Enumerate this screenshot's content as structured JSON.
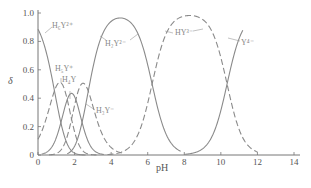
{
  "chart_data": {
    "type": "line",
    "title": "",
    "xlabel": "pH",
    "ylabel": "δ",
    "xlim": [
      0,
      14
    ],
    "ylim": [
      0,
      1.0
    ],
    "grid": false,
    "legend": "inline labels",
    "x_ticks": [
      "0",
      "2",
      "4",
      "6",
      "8",
      "10",
      "12",
      "14"
    ],
    "y_ticks": [
      "0",
      "0.2",
      "0.4",
      "0.6",
      "0.8",
      "1.0"
    ],
    "pKa": [
      0.9,
      1.6,
      2.07,
      2.75,
      6.24,
      10.34
    ],
    "series": [
      {
        "name": "H6Y2+",
        "label": "H₆Y²⁺",
        "style": "solid",
        "x_range": [
          0,
          2.6
        ],
        "points": [
          [
            0,
            0.89
          ],
          [
            0.5,
            0.72
          ],
          [
            1.0,
            0.44
          ],
          [
            1.5,
            0.18
          ],
          [
            2.0,
            0.05
          ],
          [
            2.5,
            0.01
          ]
        ]
      },
      {
        "name": "H5Y+",
        "label": "H₅Y⁺",
        "style": "dashed",
        "x_range": [
          0,
          3.2
        ],
        "points": [
          [
            0,
            0.11
          ],
          [
            0.5,
            0.29
          ],
          [
            1.0,
            0.44
          ],
          [
            1.2,
            0.45
          ],
          [
            1.5,
            0.37
          ],
          [
            2.0,
            0.2
          ],
          [
            2.5,
            0.07
          ],
          [
            3.0,
            0.02
          ]
        ]
      },
      {
        "name": "H4Y",
        "label": "H₄Y",
        "style": "solid",
        "x_range": [
          0.2,
          3.6
        ],
        "points": [
          [
            0.5,
            0.07
          ],
          [
            1.0,
            0.22
          ],
          [
            1.5,
            0.37
          ],
          [
            1.8,
            0.39
          ],
          [
            2.0,
            0.36
          ],
          [
            2.5,
            0.21
          ],
          [
            3.0,
            0.08
          ],
          [
            3.5,
            0.02
          ]
        ]
      },
      {
        "name": "H3Y-",
        "label": "H₃Y⁻",
        "style": "dashed",
        "x_range": [
          0.6,
          4.6
        ],
        "points": [
          [
            1.0,
            0.05
          ],
          [
            1.5,
            0.14
          ],
          [
            2.0,
            0.3
          ],
          [
            2.4,
            0.4
          ],
          [
            2.8,
            0.37
          ],
          [
            3.0,
            0.33
          ],
          [
            3.5,
            0.17
          ],
          [
            4.0,
            0.06
          ],
          [
            4.5,
            0.02
          ]
        ]
      },
      {
        "name": "H2Y2-",
        "label": "H₂Y²⁻",
        "style": "solid",
        "x_range": [
          1.6,
          7.8
        ],
        "points": [
          [
            2.0,
            0.1
          ],
          [
            2.5,
            0.27
          ],
          [
            3.0,
            0.55
          ],
          [
            3.5,
            0.8
          ],
          [
            4.0,
            0.92
          ],
          [
            4.4,
            0.95
          ],
          [
            5.0,
            0.94
          ],
          [
            5.5,
            0.84
          ],
          [
            6.0,
            0.63
          ],
          [
            6.5,
            0.35
          ],
          [
            7.0,
            0.14
          ],
          [
            7.5,
            0.05
          ]
        ]
      },
      {
        "name": "HY3-",
        "label": "HY³⁻",
        "style": "dashed",
        "x_range": [
          3.8,
          12.0
        ],
        "points": [
          [
            4.0,
            0.01
          ],
          [
            5.0,
            0.05
          ],
          [
            5.5,
            0.15
          ],
          [
            6.0,
            0.36
          ],
          [
            6.5,
            0.64
          ],
          [
            7.0,
            0.85
          ],
          [
            8.0,
            0.98
          ],
          [
            9.0,
            0.95
          ],
          [
            9.5,
            0.87
          ],
          [
            10.0,
            0.68
          ],
          [
            10.5,
            0.41
          ],
          [
            11.0,
            0.18
          ],
          [
            11.5,
            0.06
          ],
          [
            12.0,
            0.01
          ]
        ]
      },
      {
        "name": "Y4-",
        "label": "Y⁴⁻",
        "style": "solid",
        "x_range": [
          8.0,
          11.2
        ],
        "points": [
          [
            8.0,
            0.0
          ],
          [
            8.5,
            0.01
          ],
          [
            9.0,
            0.04
          ],
          [
            9.5,
            0.13
          ],
          [
            10.0,
            0.31
          ],
          [
            10.5,
            0.59
          ],
          [
            11.0,
            0.82
          ],
          [
            11.2,
            0.88
          ]
        ]
      }
    ]
  },
  "labels": {
    "ylabel": "δ",
    "xlabel": "pH",
    "x_ticks": [
      "0",
      "2",
      "4",
      "6",
      "8",
      "10",
      "12",
      "14"
    ],
    "y_ticks": [
      "0",
      "0.2",
      "0.4",
      "0.6",
      "0.8",
      "1.0"
    ],
    "species": {
      "h6y": "H₆Y²⁺",
      "h5y": "H₅Y⁺",
      "h4y": "H₄Y",
      "h3y": "H₃Y⁻",
      "h2y": "H₂Y²⁻",
      "hy": "HY³⁻",
      "y": "Y⁴⁻"
    }
  },
  "colors": {
    "axis": "#777777",
    "curve": "#8a8a8a",
    "label": "#999999"
  }
}
